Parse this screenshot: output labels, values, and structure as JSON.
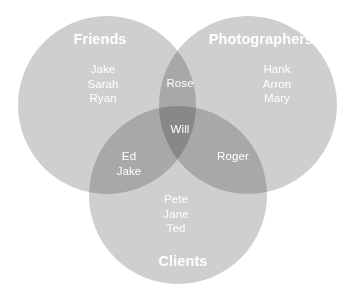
{
  "diagram": {
    "type": "venn",
    "background_color": "#ffffff",
    "text_color": "#ffffff",
    "fill_color": "#cfcfcf",
    "overlap_double_color": "#b5b5b5",
    "overlap_triple_color": "#9a9a9a",
    "sets": [
      {
        "id": "friends",
        "label": "Friends",
        "members": [
          "Jake",
          "Sarah",
          "Ryan"
        ]
      },
      {
        "id": "photographers",
        "label": "Photographers",
        "members": [
          "Hank",
          "Arron",
          "Mary"
        ]
      },
      {
        "id": "clients",
        "label": "Clients",
        "members": [
          "Pete",
          "Jane",
          "Ted"
        ]
      }
    ],
    "intersections": [
      {
        "id": "friends-photographers",
        "members": [
          "Rose"
        ]
      },
      {
        "id": "friends-clients",
        "members": [
          "Ed",
          "Jake"
        ]
      },
      {
        "id": "photographers-clients",
        "members": [
          "Roger"
        ]
      },
      {
        "id": "friends-photographers-clients",
        "members": [
          "Will"
        ]
      }
    ],
    "labels": {
      "friends_title": "Friends",
      "photographers_title": "Photographers",
      "clients_title": "Clients",
      "friends_only": "Jake\nSarah\nRyan",
      "photographers_only": "Hank\nArron\nMary",
      "clients_only": "Pete\nJane\nTed",
      "friends_photographers": "Rose",
      "friends_clients": "Ed\nJake",
      "photographers_clients": "Roger",
      "all_three": "Will"
    }
  }
}
